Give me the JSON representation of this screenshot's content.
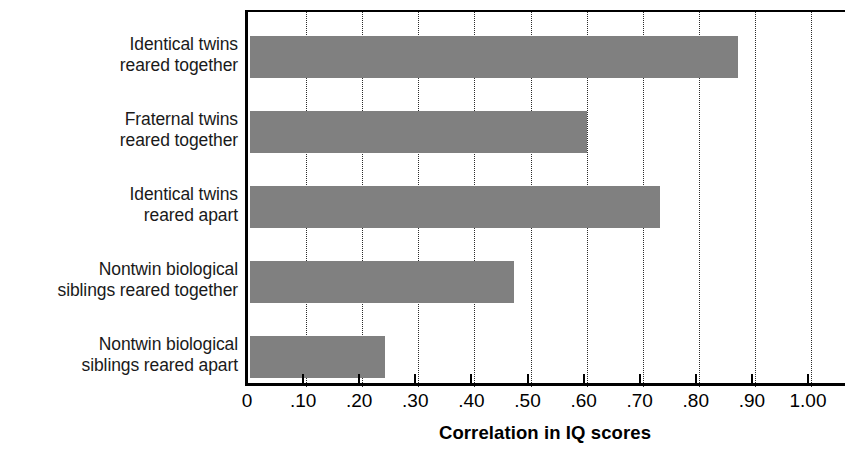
{
  "chart_data": {
    "type": "bar",
    "orientation": "horizontal",
    "title": "",
    "xlabel": "Correlation in IQ scores",
    "ylabel": "",
    "xlim": [
      0,
      1.07
    ],
    "grid": true,
    "legend": false,
    "bar_color": "#808080",
    "axis_color": "#000000",
    "categories": [
      "Identical twins reared together",
      "Fraternal twins reared together",
      "Identical twins reared apart",
      "Nontwin biological siblings reared together",
      "Nontwin biological siblings reared apart"
    ],
    "category_lines": [
      [
        "Identical twins",
        "reared together"
      ],
      [
        "Fraternal twins",
        "reared together"
      ],
      [
        "Identical twins",
        "reared apart"
      ],
      [
        "Nontwin biological",
        "siblings reared together"
      ],
      [
        "Nontwin biological",
        "siblings reared apart"
      ]
    ],
    "values": [
      0.87,
      0.6,
      0.73,
      0.47,
      0.24
    ],
    "xticks": [
      0,
      0.1,
      0.2,
      0.3,
      0.4,
      0.5,
      0.6,
      0.7,
      0.8,
      0.9,
      1.0
    ],
    "xticklabels": [
      "0",
      ".10",
      ".20",
      ".30",
      ".40",
      ".50",
      ".60",
      ".70",
      ".80",
      ".90",
      "1.00"
    ]
  }
}
